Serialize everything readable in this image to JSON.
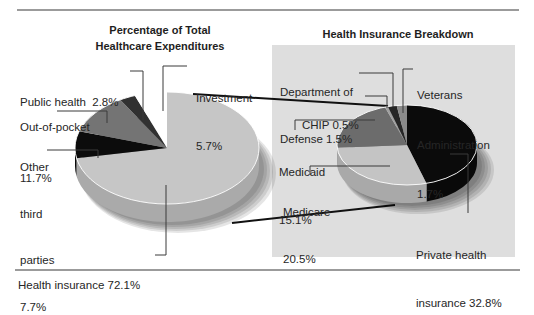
{
  "left_chart": {
    "title_lines": [
      "Percentage of Total",
      "Healthcare Expenditures"
    ],
    "labels": {
      "public_health": [
        "Public health  2.8%"
      ],
      "investment": [
        "Investment",
        "5.7%"
      ],
      "out_of_pocket": [
        "Out-of-pocket",
        "11.7%"
      ],
      "other_third_parties": [
        "Other",
        "third",
        "parties",
        "7.7%"
      ],
      "health_insurance": [
        "Health insurance 72.1%"
      ]
    }
  },
  "right_chart": {
    "title": "Health Insurance Breakdown",
    "labels": {
      "department_of_defense": [
        "Department of",
        "Defense 1.5%"
      ],
      "chip": [
        "CHIP 0.5%"
      ],
      "veterans_administration": [
        "Veterans",
        "Administration",
        "1.7%"
      ],
      "medicaid": [
        "Medicaid",
        "15.1%"
      ],
      "medicare": [
        "Medicare",
        "20.5%"
      ],
      "private_health_insurance": [
        "Private health",
        "insurance 32.8%"
      ]
    }
  },
  "colors": {
    "panel_background": "#dedede",
    "rule": "#7a7a7a",
    "leader_line": "#3a3a3a",
    "connector": "#111111"
  },
  "chart_data": [
    {
      "type": "pie",
      "style": "3d",
      "title": "Percentage of Total Healthcare Expenditures",
      "labels": [
        "Health insurance",
        "Other third parties",
        "Out-of-pocket",
        "Public health",
        "Investment"
      ],
      "values": [
        72.1,
        7.7,
        11.7,
        2.8,
        5.7
      ],
      "unit": "%",
      "colors": [
        "#c6c6c6",
        "#0c0c0c",
        "#747474",
        "#313131",
        "#ffffff"
      ],
      "start_angle": 0,
      "direction": "clockwise"
    },
    {
      "type": "pie",
      "style": "3d",
      "title": "Health Insurance Breakdown",
      "breakdown_of": "Health insurance 72.1%",
      "labels": [
        "Private health insurance",
        "Medicare",
        "Medicaid",
        "CHIP",
        "Department of Defense",
        "Veterans Administration"
      ],
      "values": [
        32.8,
        20.5,
        15.1,
        0.5,
        1.5,
        1.7
      ],
      "unit": "% of total healthcare expenditures",
      "colors": [
        "#0b0b0b",
        "#c4c4c4",
        "#6c6c6c",
        "#a0a0a0",
        "#262626",
        "#8a8a8a"
      ],
      "start_angle": 0,
      "direction": "clockwise"
    }
  ]
}
